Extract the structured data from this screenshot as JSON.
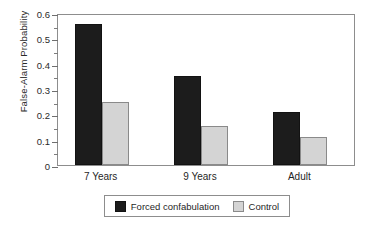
{
  "chart_data": {
    "type": "bar",
    "title": "",
    "xlabel": "",
    "ylabel": "False-Alarm Probability",
    "categories": [
      "7 Years",
      "9 Years",
      "Adult"
    ],
    "series": [
      {
        "name": "Forced confabulation",
        "color": "#1c1c1c",
        "values": [
          0.555,
          0.352,
          0.208
        ]
      },
      {
        "name": "Control",
        "color": "#d4d4d4",
        "values": [
          0.25,
          0.153,
          0.11
        ]
      }
    ],
    "ylim": [
      0,
      0.6
    ],
    "ytick_labels": [
      "0",
      "0.1",
      "0.2",
      "0.3",
      "0.4",
      "0.5",
      "0.6"
    ],
    "ytick_values": [
      0,
      0.1,
      0.2,
      0.3,
      0.4,
      0.5,
      0.6
    ],
    "yminor_tick_values": [
      0.05,
      0.15,
      0.25,
      0.35,
      0.45,
      0.55
    ],
    "grid": false,
    "legend_position": "bottom",
    "legend_entries": [
      "Forced confabulation",
      "Control"
    ]
  },
  "legend": {
    "items": [
      {
        "label": "Forced confabulation",
        "swatch": "black-square-swatch"
      },
      {
        "label": "Control",
        "swatch": "gray-square-swatch"
      }
    ]
  }
}
